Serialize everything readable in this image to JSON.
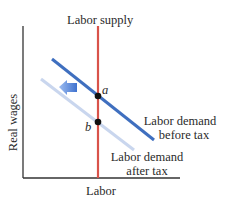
{
  "diagram": {
    "type": "supply-demand",
    "axes": {
      "x_label": "Labor",
      "y_label": "Real wages"
    },
    "curves": [
      {
        "name": "Labor supply",
        "label": "Labor supply",
        "color": "#d9534a",
        "orientation": "vertical"
      },
      {
        "name": "Labor demand before tax",
        "label_line1": "Labor demand",
        "label_line2": "before tax",
        "color": "#3f6fbf"
      },
      {
        "name": "Labor demand after tax",
        "label_line1": "Labor demand",
        "label_line2": "after tax",
        "color": "#c9d6ee"
      }
    ],
    "points": [
      {
        "label": "a",
        "description": "equilibrium before tax"
      },
      {
        "label": "b",
        "description": "equilibrium after tax"
      }
    ],
    "shift_arrow": {
      "direction": "left",
      "color": "#4a80d6"
    }
  }
}
